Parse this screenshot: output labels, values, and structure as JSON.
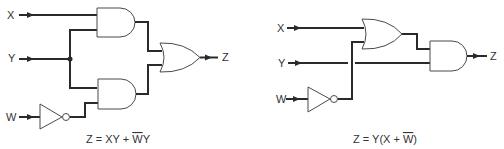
{
  "left_circuit": {
    "inputs": {
      "x": "X",
      "y": "Y",
      "w": "W"
    },
    "output": "Z",
    "gates": [
      "AND",
      "AND",
      "NOT",
      "OR"
    ],
    "equation": {
      "prefix": "Z = XY + ",
      "bar_letter": "W",
      "suffix": "Y"
    }
  },
  "right_circuit": {
    "inputs": {
      "x": "X",
      "y": "Y",
      "w": "W"
    },
    "output": "Z",
    "gates": [
      "OR",
      "NOT",
      "AND"
    ],
    "equation": {
      "prefix": "Z = Y(X + ",
      "bar_letter": "W",
      "suffix": ")"
    }
  },
  "colors": {
    "wire": "#2a2a2a",
    "gate_outline": "#4a4a4a",
    "text": "#333333",
    "background": "#ffffff"
  }
}
